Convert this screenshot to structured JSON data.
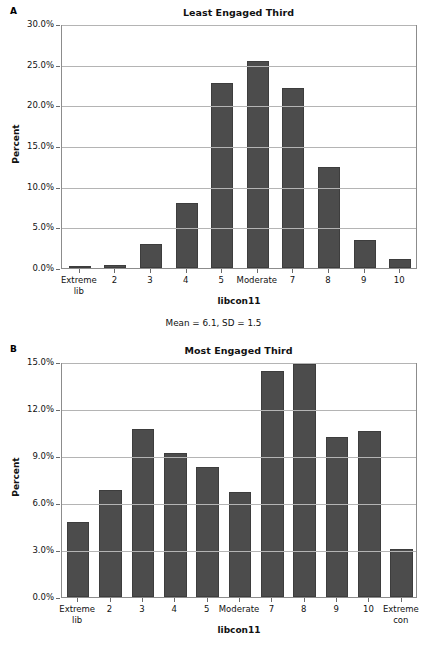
{
  "figure": {
    "panel_a_letter": "A",
    "panel_b_letter": "B"
  },
  "chart_data": [
    {
      "panel": "A",
      "type": "bar",
      "title": "Least Engaged Third",
      "xlabel": "libcon11",
      "ylabel": "Percent",
      "categories": [
        "Extreme\nlib",
        "2",
        "3",
        "4",
        "5",
        "Moderate",
        "7",
        "8",
        "9",
        "10"
      ],
      "values": [
        0.2,
        0.4,
        3.0,
        8.0,
        22.7,
        25.4,
        22.1,
        12.4,
        3.5,
        1.1
      ],
      "ylim": [
        0,
        30
      ],
      "yticks": [
        0,
        5,
        10,
        15,
        20,
        25,
        30
      ],
      "ytick_labels": [
        "0.0%",
        "5.0%",
        "10.0%",
        "15.0%",
        "20.0%",
        "25.0%",
        "30.0%"
      ],
      "grid": true,
      "legend": "none",
      "annotation": "Mean = 6.1, SD = 1.5"
    },
    {
      "panel": "B",
      "type": "bar",
      "title": "Most Engaged Third",
      "xlabel": "libcon11",
      "ylabel": "Percent",
      "categories": [
        "Extreme\nlib",
        "2",
        "3",
        "4",
        "5",
        "Moderate",
        "7",
        "8",
        "9",
        "10",
        "Extreme\ncon"
      ],
      "values": [
        4.8,
        6.8,
        10.7,
        9.2,
        8.3,
        6.7,
        14.4,
        14.9,
        10.2,
        10.6,
        3.05
      ],
      "ylim": [
        0,
        15
      ],
      "yticks": [
        0,
        3,
        6,
        9,
        12,
        15
      ],
      "ytick_labels": [
        "0.0%",
        "3.0%",
        "6.0%",
        "9.0%",
        "12.0%",
        "15.0%"
      ],
      "grid": true,
      "legend": "none"
    }
  ],
  "colors": {
    "bar_fill": "#4c4c4c",
    "bar_edge": "#3d3d3d",
    "gridline": "#b4b4b4",
    "frame": "#8c8c8c",
    "text": "#111111"
  }
}
